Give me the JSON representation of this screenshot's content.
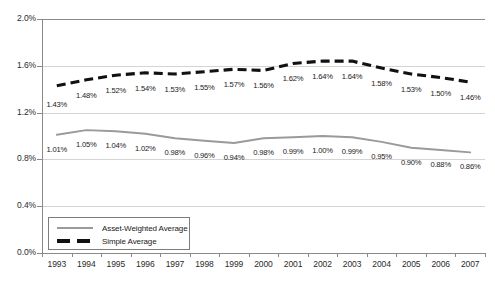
{
  "chart_data": {
    "type": "line",
    "title": "",
    "subtitle": "",
    "xlabel": "",
    "ylabel": "",
    "categories": [
      "1993",
      "1994",
      "1995",
      "1996",
      "1997",
      "1998",
      "1999",
      "2000",
      "2001",
      "2002",
      "2003",
      "2004",
      "2005",
      "2006",
      "2007"
    ],
    "ylim": [
      0.0,
      2.0
    ],
    "ytick_labels": [
      "0.0%",
      "0.4%",
      "0.8%",
      "1.2%",
      "1.6%",
      "2.0%"
    ],
    "ytick_values": [
      0.0,
      0.4,
      0.8,
      1.2,
      1.6,
      2.0
    ],
    "grid": true,
    "legend_position": "inside-lower-left",
    "series": [
      {
        "name": "Asset-Weighted Average",
        "style": "solid",
        "color": "#9a9a9a",
        "values": [
          1.01,
          1.05,
          1.04,
          1.02,
          0.98,
          0.96,
          0.94,
          0.98,
          0.99,
          1.0,
          0.99,
          0.95,
          0.9,
          0.88,
          0.86
        ],
        "labels": [
          "1.01%",
          "1.05%",
          "1.04%",
          "1.02%",
          "0.98%",
          "0.96%",
          "0.94%",
          "0.98%",
          "0.99%",
          "1.00%",
          "0.99%",
          "0.95%",
          "0.90%",
          "0.88%",
          "0.86%"
        ]
      },
      {
        "name": "Simple Average",
        "style": "dashed",
        "color": "#111111",
        "values": [
          1.43,
          1.48,
          1.52,
          1.54,
          1.53,
          1.55,
          1.57,
          1.56,
          1.62,
          1.64,
          1.64,
          1.58,
          1.53,
          1.5,
          1.46
        ],
        "labels": [
          "1.43%",
          "1.48%",
          "1.52%",
          "1.54%",
          "1.53%",
          "1.55%",
          "1.57%",
          "1.56%",
          "1.62%",
          "1.64%",
          "1.64%",
          "1.58%",
          "1.53%",
          "1.50%",
          "1.46%"
        ]
      }
    ]
  },
  "legend": {
    "items": [
      {
        "label": "Asset-Weighted Average"
      },
      {
        "label": "Simple Average"
      }
    ]
  },
  "colors": {
    "asset_weighted": "#9a9a9a",
    "simple_average": "#111111",
    "grid": "#d4d4d4",
    "axis": "#8a8a8a",
    "text": "#1a1a1a",
    "background": "#ffffff"
  }
}
